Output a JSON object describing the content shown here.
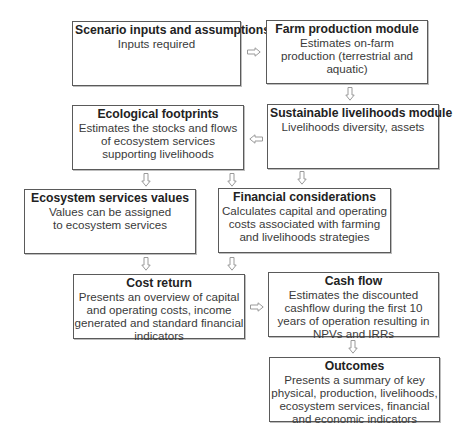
{
  "diagram": {
    "type": "flowchart",
    "boxes": [
      {
        "id": "scenario",
        "title": "Scenario inputs and assumptions",
        "desc": "Inputs required"
      },
      {
        "id": "farm",
        "title": "Farm production module",
        "desc": "Estimates on-farm production (terrestrial and aquatic)"
      },
      {
        "id": "ecological",
        "title": "Ecological footprints",
        "desc": "Estimates the stocks and flows of ecosystem services supporting livelihoods"
      },
      {
        "id": "livelihoods",
        "title": "Sustainable livelihoods module",
        "desc": "Livelihoods diversity, assets"
      },
      {
        "id": "ecosystem_values",
        "title": "Ecosystem services values",
        "desc": "Values can be assigned to ecosystem services"
      },
      {
        "id": "financial",
        "title": "Financial considerations",
        "desc": "Calculates capital and operating costs associated with farming and livelihoods strategies"
      },
      {
        "id": "cost_return",
        "title": "Cost return",
        "desc": "Presents an overview of capital and operating costs, income generated and standard financial indicators"
      },
      {
        "id": "cash_flow",
        "title": "Cash flow",
        "desc": "Estimates the discounted cashflow during the first 10 years of operation resulting in NPVs and IRRs"
      },
      {
        "id": "outcomes",
        "title": "Outcomes",
        "desc": "Presents a summary of key physical, production, livelihoods, ecosystem services, financial and economic indicators"
      }
    ],
    "edges": [
      {
        "from": "scenario",
        "to": "farm",
        "direction": "right"
      },
      {
        "from": "farm",
        "to": "livelihoods",
        "direction": "down"
      },
      {
        "from": "livelihoods",
        "to": "ecological",
        "direction": "left"
      },
      {
        "from": "ecological",
        "to": "ecosystem_values",
        "direction": "down"
      },
      {
        "from": "ecological",
        "to": "financial",
        "direction": "down"
      },
      {
        "from": "livelihoods",
        "to": "financial",
        "direction": "down"
      },
      {
        "from": "ecosystem_values",
        "to": "cost_return",
        "direction": "down"
      },
      {
        "from": "financial",
        "to": "cost_return",
        "direction": "down"
      },
      {
        "from": "cost_return",
        "to": "cash_flow",
        "direction": "right"
      },
      {
        "from": "cash_flow",
        "to": "outcomes",
        "direction": "down"
      }
    ],
    "arrow_style": "hollow block arrow",
    "colors": {
      "border": "#5a5a5a",
      "text": "#2a2a2a",
      "arrow": "#9a9a9a"
    }
  }
}
